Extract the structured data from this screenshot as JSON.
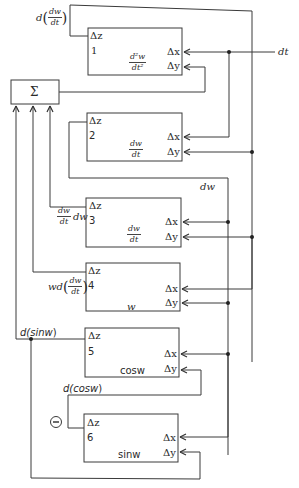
{
  "summer": {
    "label": "Σ"
  },
  "inputs": {
    "dt": "dt",
    "dw": "dw"
  },
  "integrators": [
    {
      "id": "1",
      "dz": "Δz",
      "dx": "Δx",
      "dy": "Δy",
      "value_num": "d²w",
      "value_den": "dt²"
    },
    {
      "id": "2",
      "dz": "Δz",
      "dx": "Δx",
      "dy": "Δy",
      "value_num": "dw",
      "value_den": "dt"
    },
    {
      "id": "3",
      "dz": "Δz",
      "dx": "Δx",
      "dy": "Δy",
      "value_num": "dw",
      "value_den": "dt"
    },
    {
      "id": "4",
      "dz": "Δz",
      "dx": "Δx",
      "dy": "Δy",
      "value": "w"
    },
    {
      "id": "5",
      "dz": "Δz",
      "dx": "Δx",
      "dy": "Δy",
      "value": "cosw"
    },
    {
      "id": "6",
      "dz": "Δz",
      "dx": "Δx",
      "dy": "Δy",
      "value": "sinw"
    }
  ],
  "signals": {
    "out1_prefix": "d",
    "out1_num": "dw",
    "out1_den": "dt",
    "out3_num": "dw",
    "out3_den": "dt",
    "out3_suffix": "dw",
    "out4_prefix": "wd",
    "out4_num": "dw",
    "out4_den": "dt",
    "out5": "d(sinw)",
    "out5_d": "d(sin",
    "out5_w": "w",
    "out5_close": ")",
    "cos_d": "d(cos",
    "cos_w": "w",
    "cos_close": ")",
    "negate": "−"
  }
}
